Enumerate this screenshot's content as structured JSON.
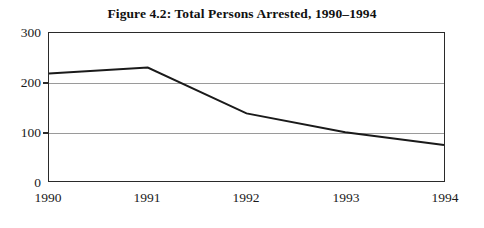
{
  "figure": {
    "title": "Figure 4.2: Total Persons Arrested, 1990–1994",
    "line_color": "#1a1a1a",
    "grid_color": "#9a9a9a",
    "frame_color": "#2a2a2a",
    "background": "#ffffff"
  },
  "chart_data": {
    "type": "line",
    "title": "Figure 4.2: Total Persons Arrested, 1990–1994",
    "xlabel": "",
    "ylabel": "",
    "categories": [
      "1990",
      "1991",
      "1992",
      "1993",
      "1994"
    ],
    "x": [
      1990,
      1991,
      1992,
      1993,
      1994
    ],
    "values": [
      218,
      230,
      137,
      99,
      73
    ],
    "series": [
      {
        "name": "Total Persons Arrested",
        "values": [
          218,
          230,
          137,
          99,
          73
        ]
      }
    ],
    "ylim": [
      0,
      300
    ],
    "yticks": [
      0,
      100,
      200,
      300
    ],
    "ytick_labels": [
      "0",
      "100",
      "200",
      "300"
    ],
    "xtick_labels": [
      "1990",
      "1991",
      "1992",
      "1993",
      "1994"
    ],
    "gridlines_y": [
      100,
      200
    ],
    "grid": true,
    "legend": false,
    "legend_position": "none",
    "annotations": []
  },
  "axis": {
    "y_labels": [
      "300",
      "200",
      "100",
      "0"
    ],
    "x_labels": [
      "1990",
      "1991",
      "1992",
      "1993",
      "1994"
    ]
  }
}
